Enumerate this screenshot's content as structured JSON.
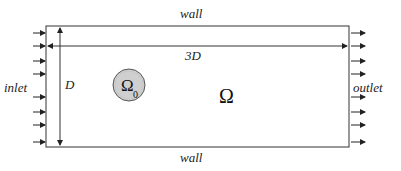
{
  "diagram": {
    "labels": {
      "wall_top": "wall",
      "wall_bottom": "wall",
      "length": "3D",
      "height": "D",
      "inlet": "inlet",
      "outlet": "outlet",
      "domain": "Ω",
      "subdomain": "Ω",
      "subdomain_subscript": "0"
    },
    "colors": {
      "line": "#333333",
      "circle_fill": "#c8c8c8",
      "circle_stroke": "#555555"
    },
    "inlet_arrow_y": [
      33,
      46,
      61,
      74,
      97,
      112,
      125,
      142
    ],
    "outlet_arrow_y": [
      33,
      46,
      61,
      74,
      97,
      112,
      125,
      142
    ]
  }
}
